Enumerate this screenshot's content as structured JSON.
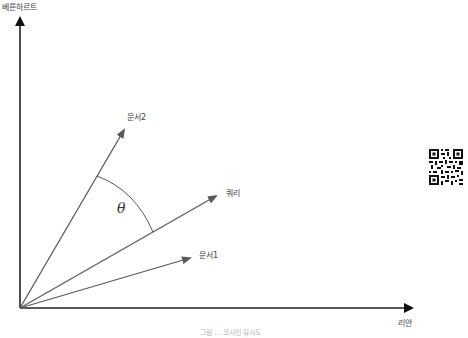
{
  "diagram": {
    "axes": {
      "y_label": "베른하르트",
      "x_label": "리안"
    },
    "vectors": [
      {
        "id": "doc2",
        "label": "문서2",
        "tip": [
          126,
          127
        ],
        "color": "#666666"
      },
      {
        "id": "query",
        "label": "쿼리",
        "tip": [
          218,
          195
        ],
        "color": "#555555"
      },
      {
        "id": "doc1",
        "label": "문서1",
        "tip": [
          192,
          257
        ],
        "color": "#666666"
      }
    ],
    "angle": {
      "symbol": "θ",
      "between": [
        "문서2",
        "쿼리"
      ]
    },
    "origin": [
      20,
      308
    ],
    "caption": "그림 ... 코사인 유사도",
    "colors": {
      "axis": "#111111",
      "vector": "#5a5a5a",
      "arc": "#444444",
      "text": "#444444"
    }
  },
  "qr_code": {
    "icon": "qr-code-icon"
  }
}
